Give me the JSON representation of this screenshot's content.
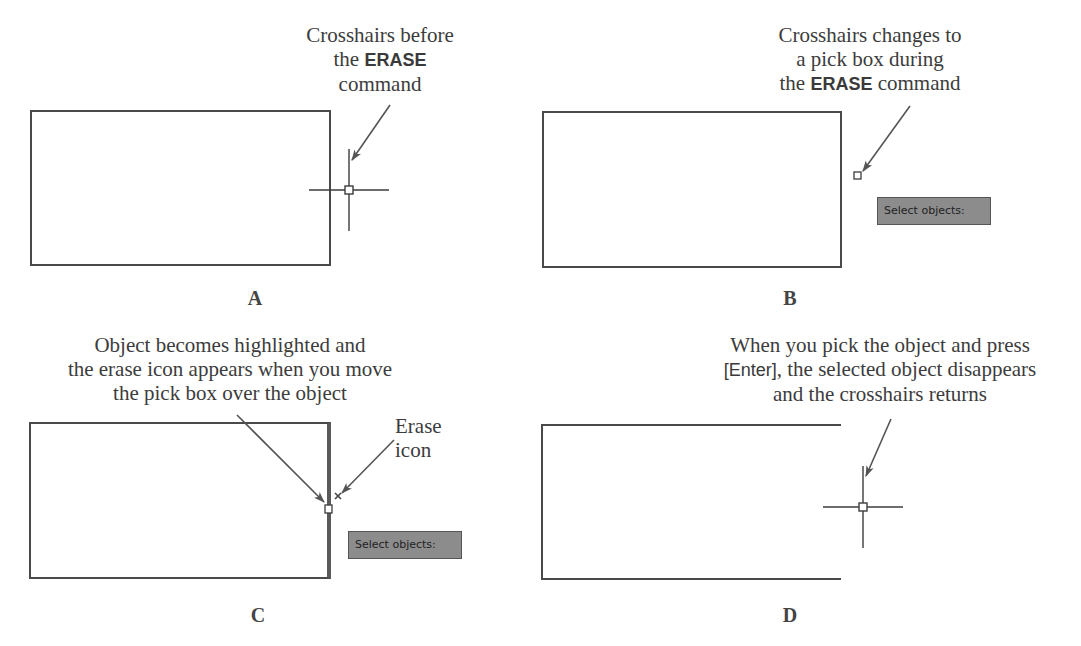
{
  "figure": {
    "panels": [
      {
        "id": "A",
        "label": "A",
        "caption_lines": [
          "Crosshairs before",
          "the",
          "ERASE",
          "command"
        ],
        "cursor": "crosshairs"
      },
      {
        "id": "B",
        "label": "B",
        "caption_lines": [
          "Crosshairs changes to",
          "a pick box during",
          "the",
          "ERASE",
          "command"
        ],
        "cursor": "pick-box",
        "prompt": "Select objects:"
      },
      {
        "id": "C",
        "label": "C",
        "caption_lines": [
          "Object becomes highlighted and",
          "the erase icon appears when you move",
          "the pick box over the object"
        ],
        "secondary_caption_lines": [
          "Erase",
          "icon"
        ],
        "cursor": "pick-box-with-erase-icon",
        "prompt": "Select objects:"
      },
      {
        "id": "D",
        "label": "D",
        "caption_lines": [
          "When you pick the object and press",
          "[Enter]",
          ", the selected object disappears",
          "and the crosshairs returns"
        ],
        "cursor": "crosshairs"
      }
    ],
    "colors": {
      "line": "#4a4a4a",
      "arrow": "#555555",
      "prompt_bg": "#8c8c8c",
      "text": "#3c3c3c"
    }
  }
}
